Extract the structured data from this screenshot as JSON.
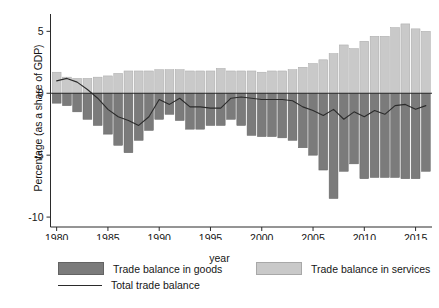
{
  "chart_data": {
    "type": "bar",
    "title": "",
    "subtitle": "",
    "xlabel": "year",
    "ylabel": "Percentage (as a share of GDP)",
    "xlim": [
      1979.4,
      2016.6
    ],
    "ylim": [
      -10.8,
      6.4
    ],
    "yticks": [
      5,
      0,
      -5,
      -10
    ],
    "ytick_labels": [
      "5",
      "0",
      "-5",
      "-10"
    ],
    "xticks": [
      1980,
      1985,
      1990,
      1995,
      2000,
      2005,
      2010,
      2015
    ],
    "xtick_labels": [
      "1980",
      "1985",
      "1990",
      "1995",
      "2000",
      "2005",
      "2010",
      "2015"
    ],
    "grid": false,
    "legend_position": "below",
    "stacked": true,
    "zero_line": true,
    "x": [
      1980,
      1981,
      1982,
      1983,
      1984,
      1985,
      1986,
      1987,
      1988,
      1989,
      1990,
      1991,
      1992,
      1993,
      1994,
      1995,
      1996,
      1997,
      1998,
      1999,
      2000,
      2001,
      2002,
      2003,
      2004,
      2005,
      2006,
      2007,
      2008,
      2009,
      2010,
      2011,
      2012,
      2013,
      2014,
      2015,
      2016
    ],
    "series": [
      {
        "name": "Trade balance in goods",
        "type": "bar",
        "color": "#7b7b7b",
        "values": [
          -0.8,
          -1.0,
          -1.5,
          -2.1,
          -2.6,
          -3.3,
          -4.2,
          -4.8,
          -3.8,
          -3.0,
          -2.1,
          -1.7,
          -2.2,
          -2.9,
          -2.9,
          -2.6,
          -2.6,
          -2.1,
          -2.6,
          -3.4,
          -3.5,
          -3.5,
          -3.6,
          -3.8,
          -4.4,
          -5.0,
          -6.2,
          -8.5,
          -6.3,
          -5.7,
          -6.9,
          -6.8,
          -6.8,
          -6.8,
          -6.9,
          -6.9,
          -6.3
        ]
      },
      {
        "name": "Trade balance in services",
        "type": "bar",
        "color": "#c9c9c9",
        "values": [
          1.7,
          1.3,
          1.2,
          1.2,
          1.3,
          1.4,
          1.6,
          1.8,
          1.8,
          1.8,
          1.9,
          1.9,
          1.9,
          1.8,
          1.8,
          1.8,
          2.0,
          1.8,
          1.8,
          1.8,
          1.7,
          1.8,
          1.8,
          1.9,
          2.1,
          2.4,
          2.7,
          3.2,
          3.9,
          3.6,
          4.2,
          4.6,
          4.6,
          5.3,
          5.6,
          5.2,
          5.0
        ]
      },
      {
        "name": "Total trade balance",
        "type": "line",
        "color": "#2b2b2b",
        "values": [
          1.0,
          1.2,
          0.9,
          0.3,
          -0.4,
          -1.3,
          -1.9,
          -2.2,
          -2.6,
          -1.9,
          -0.5,
          -0.9,
          -0.4,
          -1.1,
          -1.1,
          -1.2,
          -1.2,
          -0.4,
          -0.3,
          -0.4,
          -0.5,
          -0.5,
          -0.5,
          -0.6,
          -1.1,
          -1.4,
          -1.8,
          -1.3,
          -2.1,
          -1.5,
          -1.9,
          -1.4,
          -1.7,
          -1.0,
          -0.9,
          -1.3,
          -1.0
        ]
      }
    ]
  },
  "legend": {
    "entries": [
      {
        "label": "Trade balance in goods",
        "marker": "box-dark"
      },
      {
        "label": "Trade balance in services",
        "marker": "box-light"
      },
      {
        "label": "Total trade balance",
        "marker": "line"
      }
    ]
  },
  "colors": {
    "goods": "#7b7b7b",
    "services": "#c9c9c9",
    "total_line": "#2b2b2b",
    "axis": "#2b2b2b",
    "background": "#ffffff"
  }
}
